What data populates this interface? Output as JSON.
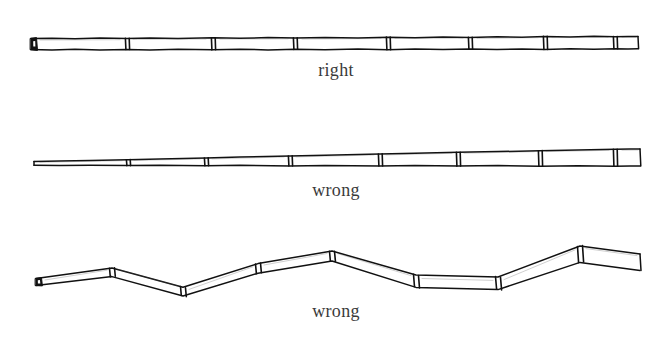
{
  "figure": {
    "background_color": "#ffffff",
    "ink_color": "#111111",
    "caption_color": "#3a3a3a",
    "title": ""
  },
  "illustrations": [
    {
      "id": "pole-straight-uniform",
      "caption": "right",
      "caption_position": {
        "x": 336,
        "y": 60
      },
      "verdict": "right",
      "shape": "straight",
      "taper": "uniform",
      "segment_count": 8,
      "node_x_positions": [
        127,
        213,
        295,
        388,
        470,
        545,
        615
      ],
      "start_x": 30,
      "end_x": 638,
      "axis_y": 44,
      "left_thickness": 11,
      "right_thickness": 11,
      "has_dark_end_cap": true
    },
    {
      "id": "pole-straight-tapered",
      "caption": "wrong",
      "caption_position": {
        "x": 336,
        "y": 180
      },
      "verdict": "wrong",
      "shape": "straight",
      "taper": "tapered",
      "segment_count": 8,
      "node_x_positions": [
        128,
        206,
        290,
        380,
        458,
        540,
        615
      ],
      "start_x": 33,
      "end_x": 640,
      "axis_y": 163,
      "left_thickness": 4,
      "right_thickness": 13,
      "has_dark_end_cap": false
    },
    {
      "id": "pole-crooked",
      "caption": "wrong",
      "caption_position": {
        "x": 336,
        "y": 301
      },
      "verdict": "wrong",
      "shape": "crooked",
      "taper": "slight",
      "segment_count": 7,
      "node_x_positions": [
        112,
        183,
        258,
        332,
        416,
        498,
        580
      ],
      "start_x": 35,
      "end_x": 640,
      "vertices": [
        {
          "x": 35,
          "y": 282
        },
        {
          "x": 112,
          "y": 272
        },
        {
          "x": 183,
          "y": 291
        },
        {
          "x": 258,
          "y": 268
        },
        {
          "x": 332,
          "y": 256
        },
        {
          "x": 416,
          "y": 280
        },
        {
          "x": 498,
          "y": 282
        },
        {
          "x": 580,
          "y": 254
        },
        {
          "x": 640,
          "y": 262
        }
      ],
      "left_thickness": 7,
      "right_thickness": 16,
      "has_dark_end_cap": true
    }
  ],
  "labels": {
    "right": "right",
    "wrong_tapered": "wrong",
    "wrong_crooked": "wrong"
  }
}
